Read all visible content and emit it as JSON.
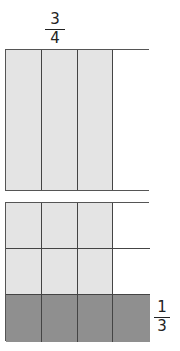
{
  "diagram": {
    "top_model": {
      "label": {
        "numerator": "3",
        "denominator": "4"
      },
      "columns": 4,
      "rows": 1,
      "shaded_columns": 3,
      "colors": {
        "light": "#e4e4e4",
        "empty": "#ffffff",
        "line": "#444444"
      }
    },
    "bottom_model": {
      "label": {
        "numerator": "1",
        "denominator": "3"
      },
      "columns": 4,
      "rows": 3,
      "cells": [
        [
          "light",
          "light",
          "light",
          "empty"
        ],
        [
          "light",
          "light",
          "light",
          "empty"
        ],
        [
          "dark",
          "dark",
          "dark",
          "dark"
        ]
      ],
      "colors": {
        "light": "#e4e4e4",
        "dark": "#8f8f8f",
        "empty": "#ffffff",
        "line": "#444444"
      }
    }
  }
}
